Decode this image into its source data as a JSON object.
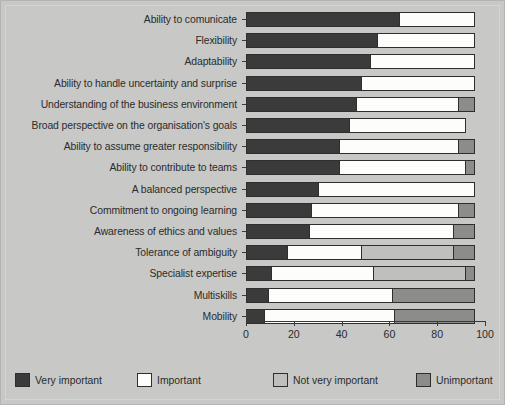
{
  "chart_data": {
    "type": "bar",
    "orientation": "horizontal",
    "stacked": true,
    "title": "",
    "xlabel": "",
    "ylabel": "",
    "xlim": [
      0,
      100
    ],
    "xticks": [
      0,
      20,
      40,
      60,
      80,
      100
    ],
    "xticklabels": [
      "0",
      "20",
      "40",
      "60",
      "80",
      "100"
    ],
    "grid": false,
    "legend_position": "bottom",
    "categories": [
      "Ability to comunicate",
      "Flexibility",
      "Adaptability",
      "Ability to handle uncertainty and surprise",
      "Understanding of the business environment",
      "Broad perspective on the organisation's goals",
      "Ability to assume greater responsibility",
      "Ability to contribute to teams",
      "A balanced perspective",
      "Commitment to ongoing learning",
      "Awareness of ethics and values",
      "Tolerance of ambiguity",
      "Specialist expertise",
      "Multiskills",
      "Mobility"
    ],
    "series": [
      {
        "name": "Very important",
        "color": "#3b3b3b",
        "values": [
          64,
          55,
          52,
          48,
          46,
          43,
          39,
          39,
          30,
          27,
          26,
          17,
          10,
          9,
          7
        ]
      },
      {
        "name": "Important",
        "color": "#fdfdfb",
        "values": [
          32,
          41,
          44,
          48,
          43,
          49,
          50,
          53,
          66,
          62,
          61,
          31,
          43,
          52,
          55
        ]
      },
      {
        "name": "Not very important",
        "color": "#bfbfbd",
        "values": [
          0,
          0,
          0,
          0,
          0,
          0,
          0,
          0,
          0,
          0,
          0,
          39,
          39,
          0,
          0
        ]
      },
      {
        "name": "Unimportant",
        "color": "#8c8c8a",
        "values": [
          0,
          0,
          0,
          0,
          7,
          0,
          7,
          4,
          0,
          7,
          9,
          9,
          4,
          35,
          34
        ]
      }
    ]
  },
  "legend": {
    "items": [
      {
        "label": "Very important",
        "color": "#3b3b3b"
      },
      {
        "label": "Important",
        "color": "#fdfdfb"
      },
      {
        "label": "Not very important",
        "color": "#bfbfbd"
      },
      {
        "label": "Unimportant",
        "color": "#8c8c8a"
      }
    ]
  },
  "colors": {
    "background": "#c8c8c6",
    "axis": "#3a3a3a",
    "text": "#2b2b2b"
  }
}
